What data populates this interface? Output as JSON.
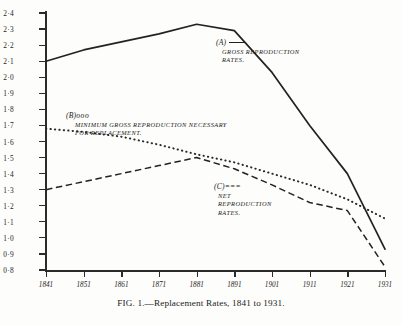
{
  "caption": "FIG. 1.—Replacement Rates, 1841 to 1931.",
  "annotations": {
    "a": {
      "key": "(A)",
      "marker": "solid-line",
      "line1": "GROSS  REPRODUCTION",
      "line2": "RATES."
    },
    "b": {
      "key": "(B)",
      "marker": "ooo",
      "line1": "MINIMUM  GROSS REPRODUCTION NECESSARY",
      "line2": "FOR  REPLACEMENT."
    },
    "c": {
      "key": "(C)",
      "marker": "===",
      "line1": "NET",
      "line2": "REPRODUCTION",
      "line3": "RATES."
    }
  },
  "colors": {
    "ink": "#222222",
    "paper": "#fdfdfb"
  },
  "chart_data": {
    "type": "line",
    "title": "FIG. 1.—Replacement Rates, 1841 to 1931.",
    "xlabel": "",
    "ylabel": "",
    "grid": false,
    "legend_position": "inline-annotations",
    "x": [
      "1841",
      "1851",
      "1861",
      "1871",
      "1881",
      "1891",
      "1901",
      "1911",
      "1921",
      "1931"
    ],
    "xlim": [
      "1841",
      "1931"
    ],
    "ylim": [
      0.8,
      2.4
    ],
    "yticks": [
      "2·4",
      "2·3",
      "2·2",
      "2·1",
      "2·0",
      "1·9",
      "1·8",
      "1·7",
      "1·6",
      "1·5",
      "1·4",
      "1·3",
      "1·2",
      "1·1",
      "1·0",
      "0·9",
      "0·8"
    ],
    "ytick_values": [
      2.4,
      2.3,
      2.2,
      2.1,
      2.0,
      1.9,
      1.8,
      1.7,
      1.6,
      1.5,
      1.4,
      1.3,
      1.2,
      1.1,
      1.0,
      0.9,
      0.8
    ],
    "series": [
      {
        "name": "(A) Gross Reproduction Rates",
        "style": "solid",
        "values": [
          2.1,
          2.17,
          2.22,
          2.27,
          2.33,
          2.29,
          2.03,
          1.7,
          1.4,
          0.93
        ]
      },
      {
        "name": "(B) Minimum Gross Reproduction necessary for Replacement",
        "style": "dotted",
        "values": [
          1.68,
          1.66,
          1.63,
          1.58,
          1.52,
          1.47,
          1.4,
          1.33,
          1.24,
          1.12
        ]
      },
      {
        "name": "(C) Net Reproduction Rates",
        "style": "dashed",
        "values": [
          1.3,
          1.35,
          1.4,
          1.45,
          1.5,
          1.43,
          1.33,
          1.22,
          1.17,
          0.82
        ]
      }
    ]
  }
}
